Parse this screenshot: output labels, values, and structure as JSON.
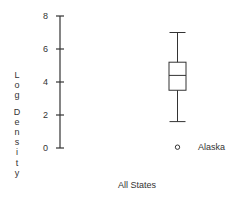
{
  "chart_data": {
    "type": "boxplot",
    "title": "",
    "xlabel": "All States",
    "ylabel": "Log Density",
    "ylim": [
      0,
      8
    ],
    "yticks": [
      0,
      2,
      4,
      6,
      8
    ],
    "ytick_labels": [
      "0",
      "2",
      "4",
      "6",
      "8"
    ],
    "grid": false,
    "series": [
      {
        "name": "All States",
        "whisker_low": 1.6,
        "q1": 3.5,
        "median": 4.4,
        "q3": 5.2,
        "whisker_high": 7.0,
        "outliers": [
          {
            "value": 0.05,
            "label": "Alaska"
          }
        ]
      }
    ],
    "colors": {
      "ink": "#333333",
      "background": "#ffffff"
    }
  }
}
